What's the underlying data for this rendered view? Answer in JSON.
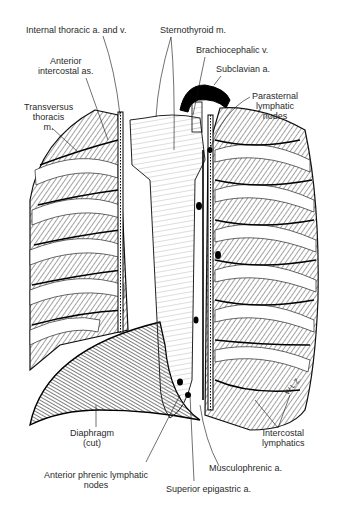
{
  "figure": {
    "signature": "WLZ"
  },
  "labels": {
    "internal_thoracic": "Internal thoracic a. and v.",
    "anterior_intercostal": [
      "Anterior",
      "intercostal as."
    ],
    "transversus_thoracis": [
      "Transversus",
      "thoracis",
      "m."
    ],
    "sternothyroid": "Sternothyroid m.",
    "brachiocephalic": "Brachiocephalic v.",
    "subclavian": "Subclavian a.",
    "parasternal": [
      "Parasternal",
      "lymphatic",
      "nodes"
    ],
    "diaphragm": [
      "Diaphragm",
      "(cut)"
    ],
    "intercostal_lymphatics": [
      "Intercostal",
      "lymphatics"
    ],
    "musculophrenic": "Musculophrenic a.",
    "anterior_phrenic": [
      "Anterior phrenic lymphatic",
      "nodes"
    ],
    "superior_epigastric": "Superior epigastric a."
  },
  "colors": {
    "ink": "#1a1a1a",
    "label": "#2a2a2a",
    "background": "#ffffff"
  }
}
